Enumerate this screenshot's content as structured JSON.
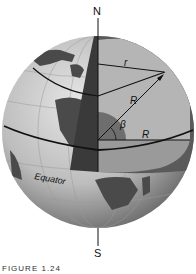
{
  "diagram": {
    "labels": {
      "north": "N",
      "south": "S",
      "equator": "Equator",
      "small_radius": "r",
      "radius_upper": "R",
      "radius_lower": "R",
      "angle": "β"
    },
    "caption": "FIGURE 1.24",
    "colors": {
      "ocean": "#c8c8c8",
      "land": "#4a4a4a",
      "cut_face": "#9a9a9a",
      "cut_face_light": "#b5b5b5",
      "core": "#6e6e6e",
      "lines": "#111111"
    }
  }
}
